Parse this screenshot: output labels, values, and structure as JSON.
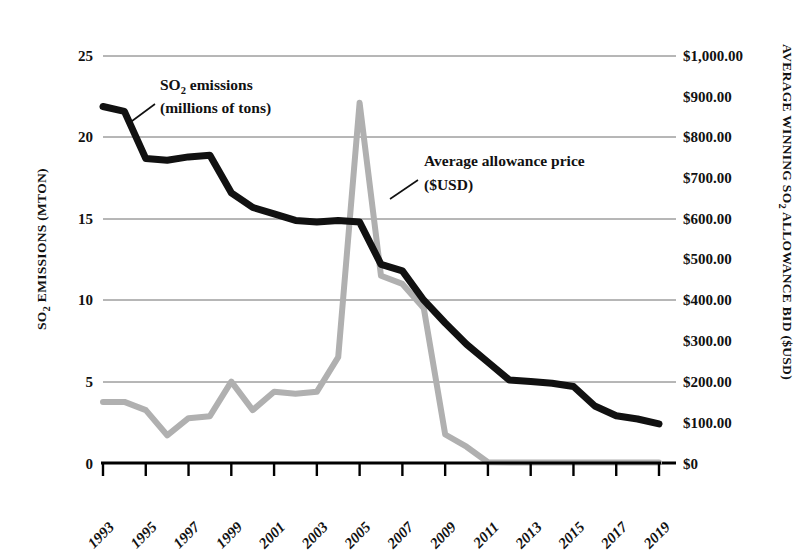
{
  "chart_data": {
    "type": "line",
    "title": "",
    "x": [
      1993,
      1994,
      1995,
      1996,
      1997,
      1998,
      1999,
      2000,
      2001,
      2002,
      2003,
      2004,
      2005,
      2006,
      2007,
      2008,
      2009,
      2010,
      2011,
      2012,
      2013,
      2014,
      2015,
      2016,
      2017,
      2018,
      2019
    ],
    "xlabel": "",
    "xtick_labels": [
      "1993",
      "1995",
      "1997",
      "1999",
      "2001",
      "2003",
      "2005",
      "2007",
      "2009",
      "2011",
      "2013",
      "2015",
      "2017",
      "2019"
    ],
    "xlim": [
      1993,
      2019
    ],
    "grid": true,
    "legend": "annotations",
    "left_axis": {
      "label": "SO2 EMISSIONS (MTON)",
      "label_main": "SO",
      "label_sub": "2",
      "label_rest": " EMISSIONS (MTON)",
      "ylim": [
        0,
        25
      ],
      "ticks": [
        0,
        5,
        10,
        15,
        20,
        25
      ],
      "tick_labels": [
        "0",
        "5",
        "10",
        "15",
        "20",
        "25"
      ]
    },
    "right_axis": {
      "label": "AVERAGE WINNING SO2 ALLOWANCE BID ($USD)",
      "label_part1": "AVERAGE WINNING SO",
      "label_sub": "2",
      "label_part2": " ALLOWANCE BID ($USD)",
      "ylim": [
        0,
        1000
      ],
      "ticks": [
        0,
        100,
        200,
        300,
        400,
        500,
        600,
        700,
        800,
        900,
        1000
      ],
      "tick_labels": [
        "$0",
        "$100.00",
        "$200.00",
        "$300.00",
        "$400.00",
        "$500.00",
        "$600.00",
        "$700.00",
        "$800.00",
        "$900.00",
        "$1,000.00"
      ]
    },
    "series": [
      {
        "name": "SO2 emissions (millions of tons)",
        "axis": "left",
        "color": "#111111",
        "units": "million tons",
        "values": [
          21.9,
          21.6,
          18.7,
          18.6,
          18.8,
          18.9,
          16.6,
          15.7,
          15.3,
          14.9,
          14.8,
          14.9,
          14.8,
          12.2,
          11.8,
          10.0,
          8.6,
          7.3,
          6.2,
          5.1,
          5.0,
          4.9,
          4.7,
          3.5,
          2.9,
          2.7,
          2.4
        ]
      },
      {
        "name": "Average allowance price ($USD)",
        "axis": "right",
        "color": "#b0b0b0",
        "units": "USD",
        "values": [
          150,
          150,
          130,
          68,
          110,
          115,
          200,
          130,
          175,
          170,
          175,
          260,
          885,
          460,
          440,
          380,
          70,
          40,
          2,
          1,
          1,
          1,
          1,
          1,
          1,
          1,
          1
        ]
      }
    ],
    "annotations": [
      {
        "name": "so2-emissions-annotation",
        "line1_main": "SO",
        "line1_sub": "2",
        "line1_rest": " emissions",
        "line2": "(millions of tons)"
      },
      {
        "name": "allowance-price-annotation",
        "line1": "Average allowance price",
        "line2": "($USD)"
      }
    ]
  }
}
